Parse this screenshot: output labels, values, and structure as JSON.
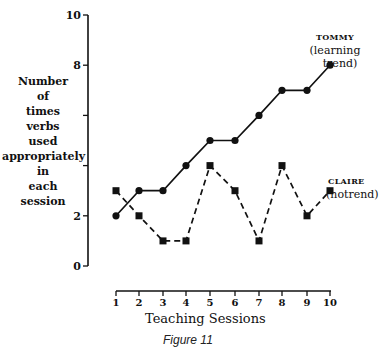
{
  "chart_data": {
    "type": "line",
    "title": "",
    "caption": "Figure 11",
    "xlabel": "Teaching Sessions",
    "ylabel": "Number of times verbs used appropriately in each session",
    "ylabel_lines": [
      "Number",
      "of",
      "times",
      "verbs",
      "used",
      "appropriately",
      "in",
      "each",
      "session"
    ],
    "x": [
      1,
      2,
      3,
      4,
      5,
      6,
      7,
      8,
      9,
      10
    ],
    "x_tick_labels": [
      "1",
      "2",
      "3",
      "4",
      "5",
      "6",
      "7",
      "8",
      "9",
      "10"
    ],
    "y_ticks": [
      0,
      2,
      4,
      6,
      8,
      10
    ],
    "y_tick_labels": [
      "0",
      "2",
      "",
      "",
      "8",
      "10"
    ],
    "ylim": [
      0,
      10
    ],
    "xlim": [
      1,
      10
    ],
    "grid": false,
    "legend_position": "inline-right",
    "series": [
      {
        "name": "TOMMY",
        "annotation": "(learning trend)",
        "annotation_lines": [
          "(learning",
          "trend)"
        ],
        "marker": "circle",
        "line_style": "solid",
        "values": [
          2,
          3,
          3,
          4,
          5,
          5,
          6,
          7,
          7,
          8
        ]
      },
      {
        "name": "CLAIRE",
        "annotation": "(notrend)",
        "annotation_lines": [
          "(notrend)"
        ],
        "marker": "square",
        "line_style": "dashed",
        "values": [
          3,
          2,
          1,
          1,
          4,
          3,
          1,
          4,
          2,
          3
        ]
      }
    ]
  },
  "colors": {
    "ink": "#111111",
    "background": "#ffffff"
  }
}
